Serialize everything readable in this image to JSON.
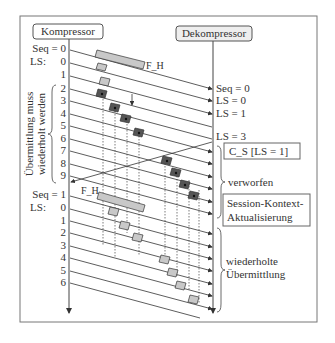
{
  "compressor": {
    "label": "Kompressor"
  },
  "decompressor": {
    "label": "Dekompressor"
  },
  "left_labels": {
    "seq0": "Seq = 0",
    "ls_prefix": "LS:",
    "seq1": "Seq = 1",
    "first_block": [
      "0",
      "1",
      "2",
      "3",
      "4",
      "5",
      "6",
      "7",
      "8",
      "9"
    ],
    "second_block": [
      "0",
      "1",
      "2",
      "3",
      "4",
      "5",
      "6"
    ]
  },
  "brace_label_left": {
    "line1": "Übermittlung muss",
    "line2": "wiederholt werden"
  },
  "packet_labels": {
    "fh1": "F_H",
    "fh2": "F_H"
  },
  "receiver_labels": [
    "Seq = 0",
    "LS = 0",
    "LS = 1",
    "LS = 3"
  ],
  "cs_box": "C_S  [LS = 1]",
  "discarded": "verworfen",
  "session_box": {
    "line1": "Session-Kontext-",
    "line2": "Aktualisierung"
  },
  "retransmission": {
    "line1": "wiederholte",
    "line2": "Übermittlung"
  },
  "colors": {
    "line": "#333333",
    "packet_light": "#c8c8c8",
    "packet_dark": "#555555",
    "frame": "#666666"
  }
}
